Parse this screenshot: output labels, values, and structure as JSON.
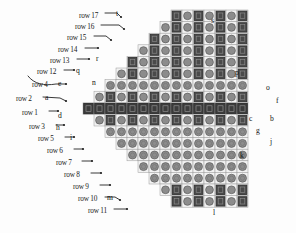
{
  "figure": {
    "kind": "hexagonal-lattice-diagram",
    "background_color": "#fdfdfd",
    "ink_color": "#1a1a1a"
  },
  "palette": {
    "dark_cell": "#4a4a4a",
    "dark_cell_edge": "#2b2b2b",
    "mid_cell": "#8c8c8c",
    "mid_cell_edge": "#5a5a5a",
    "light_cell": "#f2f2f2",
    "light_cell_edge": "#9a9a9a",
    "band_cell": "#3c3c3c",
    "leader_line": "#222222",
    "text": "#141414"
  },
  "row_labels": [
    {
      "id": "row-17",
      "text": "row 17",
      "x": 79,
      "y": 15
    },
    {
      "id": "row-16",
      "text": "row 16",
      "x": 75,
      "y": 26
    },
    {
      "id": "row-15",
      "text": "row 15",
      "x": 67,
      "y": 37
    },
    {
      "id": "row-14",
      "text": "row 14",
      "x": 58,
      "y": 49
    },
    {
      "id": "row-13",
      "text": "row 13",
      "x": 50,
      "y": 60
    },
    {
      "id": "row-12",
      "text": "row 12",
      "x": 37,
      "y": 71
    },
    {
      "id": "row-4",
      "text": "row 4",
      "x": 32,
      "y": 84
    },
    {
      "id": "row-2",
      "text": "row 2",
      "x": 16,
      "y": 98
    },
    {
      "id": "row-1",
      "text": "row 1",
      "x": 22,
      "y": 112
    },
    {
      "id": "row-3",
      "text": "row 3",
      "x": 29,
      "y": 126
    },
    {
      "id": "row-5",
      "text": "row 5",
      "x": 38,
      "y": 138
    },
    {
      "id": "row-6",
      "text": "row 6",
      "x": 47,
      "y": 150
    },
    {
      "id": "row-7",
      "text": "row 7",
      "x": 56,
      "y": 162
    },
    {
      "id": "row-8",
      "text": "row 8",
      "x": 64,
      "y": 174
    },
    {
      "id": "row-9",
      "text": "row 9",
      "x": 73,
      "y": 186
    },
    {
      "id": "row-10",
      "text": "row 10",
      "x": 78,
      "y": 198
    },
    {
      "id": "row-11",
      "text": "row 11",
      "x": 88,
      "y": 210
    }
  ],
  "cell_labels": [
    {
      "id": "cell-t",
      "text": "t",
      "x": 116,
      "y": 13
    },
    {
      "id": "cell-s",
      "text": "s",
      "x": 211,
      "y": 20
    },
    {
      "id": "cell-r",
      "text": "r",
      "x": 96,
      "y": 58
    },
    {
      "id": "cell-q",
      "text": "q",
      "x": 76,
      "y": 70
    },
    {
      "id": "cell-p",
      "text": "p",
      "x": 235,
      "y": 72
    },
    {
      "id": "cell-n",
      "text": "n",
      "x": 92,
      "y": 82
    },
    {
      "id": "cell-e",
      "text": "e",
      "x": 58,
      "y": 83
    },
    {
      "id": "cell-o",
      "text": "o",
      "x": 266,
      "y": 87
    },
    {
      "id": "cell-a",
      "text": "a",
      "x": 45,
      "y": 97
    },
    {
      "id": "cell-f",
      "text": "f",
      "x": 276,
      "y": 100
    },
    {
      "id": "cell-c",
      "text": "c",
      "x": 249,
      "y": 118
    },
    {
      "id": "cell-b",
      "text": "b",
      "x": 270,
      "y": 118
    },
    {
      "id": "cell-d",
      "text": "d",
      "x": 58,
      "y": 115
    },
    {
      "id": "cell-g",
      "text": "g",
      "x": 256,
      "y": 130
    },
    {
      "id": "cell-j",
      "text": "j",
      "x": 270,
      "y": 141
    },
    {
      "id": "cell-h",
      "text": "h",
      "x": 56,
      "y": 127
    },
    {
      "id": "cell-i",
      "text": "i",
      "x": 70,
      "y": 137
    },
    {
      "id": "cell-k",
      "text": "k",
      "x": 240,
      "y": 155
    },
    {
      "id": "cell-m",
      "text": "m",
      "x": 107,
      "y": 197
    },
    {
      "id": "cell-l",
      "text": "l",
      "x": 213,
      "y": 212
    }
  ],
  "leaders": [
    {
      "id": "leader-row17",
      "d": "M 105 13 L 117 13 L 121 17"
    },
    {
      "id": "leader-row16",
      "d": "M 101 25 L 119 25 L 124 29"
    },
    {
      "id": "leader-row15",
      "d": "M 94 36 L 106 36 L 111 40"
    },
    {
      "id": "leader-row14",
      "d": "M 85 48 L 98 48"
    },
    {
      "id": "leader-row13",
      "d": "M 77 59 L 89 59"
    },
    {
      "id": "leader-row12",
      "d": "M 64 70 L 74 70"
    },
    {
      "id": "leader-row4",
      "d": "M 28 76 C 34 84 44 86 56 84 L 66 84"
    },
    {
      "id": "leader-row2",
      "d": "M 43 97 L 60 98 L 66 101"
    },
    {
      "id": "leader-row1",
      "d": "M 49 111 L 58 111"
    },
    {
      "id": "leader-row3",
      "d": "M 56 125 L 64 125"
    },
    {
      "id": "leader-row5",
      "d": "M 65 137 L 74 137"
    },
    {
      "id": "leader-row6",
      "d": "M 74 149 L 83 149"
    },
    {
      "id": "leader-row7",
      "d": "M 82 161 L 92 161"
    },
    {
      "id": "leader-row8",
      "d": "M 91 173 L 101 173"
    },
    {
      "id": "leader-row9",
      "d": "M 100 185 L 110 185"
    },
    {
      "id": "leader-row10",
      "d": "M 105 197 L 115 197 L 120 200"
    },
    {
      "id": "leader-row11",
      "d": "M 114 209 L 127 209"
    }
  ],
  "grid": {
    "rows": 17,
    "origin_x": 105,
    "origin_y": 10,
    "cell_w": 11.0,
    "cell_h": 11.6,
    "row_counts": [
      7,
      8,
      9,
      10,
      11,
      12,
      13,
      14,
      15,
      14,
      13,
      12,
      11,
      10,
      9,
      8,
      7
    ],
    "row_offsets": [
      6.0,
      5.0,
      4.0,
      3.0,
      2.0,
      1.0,
      0.0,
      -1.0,
      -2.0,
      -1.0,
      0.0,
      1.0,
      2.0,
      3.0,
      4.0,
      5.0,
      6.0
    ],
    "row_styles": [
      "square-dark",
      "square-dark",
      "square-dark",
      "square-dark",
      "square-dark",
      "square-dark",
      "circle-mid",
      "square-dark",
      "band-dark",
      "square-dark",
      "circle-mid",
      "circle-mid",
      "circle-mid",
      "circle-mid",
      "circle-mid",
      "square-dark",
      "square-dark"
    ]
  }
}
